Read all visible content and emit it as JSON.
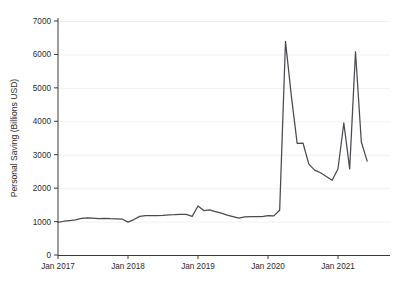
{
  "chart_data": {
    "type": "line",
    "title": "",
    "subtitle": "",
    "xlabel": "",
    "ylabel": "Personal Saving (Billions USD)",
    "ylim": [
      0,
      7000
    ],
    "xlim": [
      "2016-12",
      "2021-08"
    ],
    "grid": true,
    "legend": null,
    "legend_position": "none",
    "y_ticks": [
      0,
      1000,
      2000,
      3000,
      4000,
      5000,
      6000,
      7000
    ],
    "y_tick_labels": [
      "0",
      "1000",
      "2000",
      "3000",
      "4000",
      "5000",
      "6000",
      "7000"
    ],
    "x_ticks": [
      "Jan 2017",
      "Jan 2018",
      "Jan 2019",
      "Jan 2020",
      "Jan 2021"
    ],
    "x_tick_labels": [
      "Jan 2017",
      "Jan 2018",
      "Jan 2019",
      "Jan 2020",
      "Jan 2021"
    ],
    "line_color": "#4a4a52",
    "grid_color": "#ececec",
    "axis_color": "#3a3a3a",
    "background_color": "#ffffff",
    "series": [
      {
        "name": "Personal Saving",
        "x": [
          "2017-01",
          "2017-02",
          "2017-03",
          "2017-04",
          "2017-05",
          "2017-06",
          "2017-07",
          "2017-08",
          "2017-09",
          "2017-10",
          "2017-11",
          "2017-12",
          "2018-01",
          "2018-02",
          "2018-03",
          "2018-04",
          "2018-05",
          "2018-06",
          "2018-07",
          "2018-08",
          "2018-09",
          "2018-10",
          "2018-11",
          "2018-12",
          "2019-01",
          "2019-02",
          "2019-03",
          "2019-04",
          "2019-05",
          "2019-06",
          "2019-07",
          "2019-08",
          "2019-09",
          "2019-10",
          "2019-11",
          "2019-12",
          "2020-01",
          "2020-02",
          "2020-03",
          "2020-04",
          "2020-05",
          "2020-06",
          "2020-07",
          "2020-08",
          "2020-09",
          "2020-10",
          "2020-11",
          "2020-12",
          "2021-01",
          "2021-02",
          "2021-03",
          "2021-04",
          "2021-05",
          "2021-06"
        ],
        "values": [
          975,
          1010,
          1030,
          1050,
          1095,
          1110,
          1105,
          1090,
          1095,
          1085,
          1080,
          1075,
          985,
          1060,
          1155,
          1175,
          1180,
          1180,
          1185,
          1200,
          1205,
          1215,
          1215,
          1155,
          1465,
          1330,
          1350,
          1300,
          1250,
          1195,
          1150,
          1105,
          1140,
          1150,
          1145,
          1150,
          1180,
          1170,
          1340,
          6390,
          4760,
          3340,
          3350,
          2720,
          2540,
          2460,
          2350,
          2235,
          2580,
          3950,
          2575,
          6080,
          3380,
          2810
        ]
      }
    ],
    "annotations": [
      {
        "label": "COVID-19 stimulus peak",
        "x": "2020-04",
        "y": 6390
      },
      {
        "label": "Second stimulus peak",
        "x": "2021-04",
        "y": 6080
      }
    ]
  },
  "axes": {
    "y_axis_label": "Personal Saving (Billions USD)",
    "x_axis_label": ""
  }
}
